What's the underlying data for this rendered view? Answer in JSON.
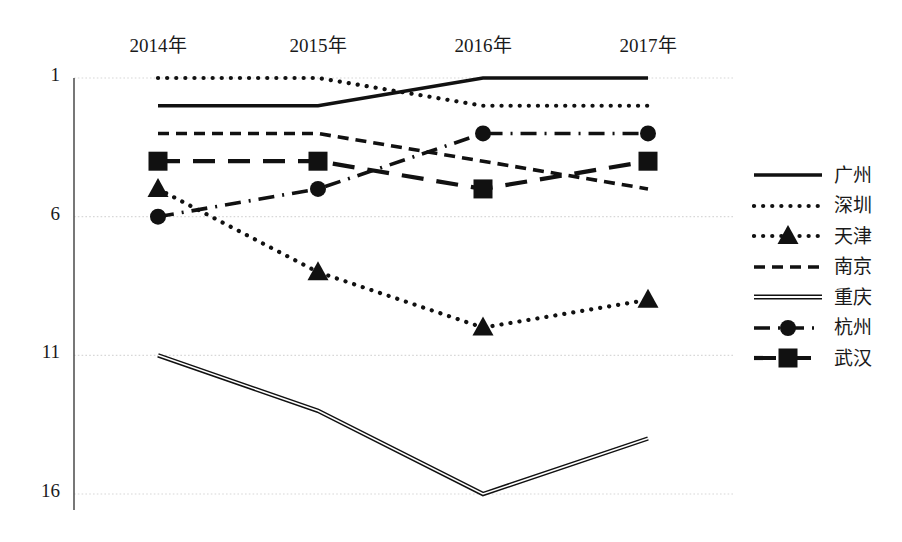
{
  "chart_data": {
    "type": "line",
    "title": "",
    "xlabel": "",
    "ylabel": "",
    "categories": [
      "2014年",
      "2015年",
      "2016年",
      "2017年"
    ],
    "yticks": [
      "1",
      "6",
      "11",
      "16"
    ],
    "ytick_values": [
      1,
      6,
      11,
      16
    ],
    "ylim": [
      1,
      16
    ],
    "y_inverted": true,
    "grid": true,
    "legend_position": "right",
    "series": [
      {
        "name": "广州",
        "values": [
          2,
          2,
          1,
          1
        ],
        "style": "solid-thick",
        "marker": "none"
      },
      {
        "name": "深圳",
        "values": [
          1,
          1,
          2,
          2
        ],
        "style": "dotted",
        "marker": "none"
      },
      {
        "name": "天津",
        "values": [
          5,
          8,
          10,
          9
        ],
        "style": "dotted",
        "marker": "triangle"
      },
      {
        "name": "南京",
        "values": [
          3,
          3,
          4,
          5
        ],
        "style": "dashed",
        "marker": "none"
      },
      {
        "name": "重庆",
        "values": [
          11,
          13,
          16,
          14
        ],
        "style": "solid-thin",
        "marker": "none"
      },
      {
        "name": "杭州",
        "values": [
          6,
          5,
          3,
          3
        ],
        "style": "dash-dot",
        "marker": "circle"
      },
      {
        "name": "武汉",
        "values": [
          4,
          4,
          5,
          4
        ],
        "style": "long-dash",
        "marker": "square"
      }
    ]
  },
  "axis": {
    "x_labels": [
      "2014年",
      "2015年",
      "2016年",
      "2017年"
    ],
    "y_labels": [
      "1",
      "6",
      "11",
      "16"
    ]
  },
  "legend": {
    "items": [
      {
        "label": "广州"
      },
      {
        "label": "深圳"
      },
      {
        "label": "天津"
      },
      {
        "label": "南京"
      },
      {
        "label": "重庆"
      },
      {
        "label": "杭州"
      },
      {
        "label": "武汉"
      }
    ]
  },
  "colors": {
    "line": "#111111",
    "grid": "#d8d8d8",
    "axis": "#555555",
    "text": "#1a1a1a",
    "background": "#ffffff"
  }
}
